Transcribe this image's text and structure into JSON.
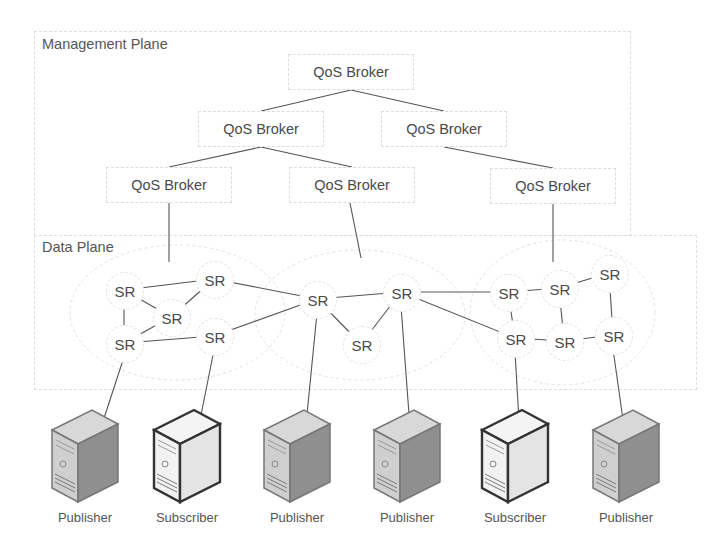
{
  "planes": {
    "management": {
      "label": "Management Plane"
    },
    "data": {
      "label": "Data Plane"
    }
  },
  "brokers": [
    {
      "id": "b0",
      "label": "QoS Broker",
      "x": 288,
      "y": 54
    },
    {
      "id": "b1",
      "label": "QoS Broker",
      "x": 198,
      "y": 111
    },
    {
      "id": "b2",
      "label": "QoS Broker",
      "x": 381,
      "y": 111
    },
    {
      "id": "b3",
      "label": "QoS Broker",
      "x": 106,
      "y": 167
    },
    {
      "id": "b4",
      "label": "QoS Broker",
      "x": 289,
      "y": 167
    },
    {
      "id": "b5",
      "label": "QoS Broker",
      "x": 490,
      "y": 168
    }
  ],
  "routers": [
    {
      "id": "s0",
      "label": "SR",
      "x": 124,
      "y": 290
    },
    {
      "id": "s1",
      "label": "SR",
      "x": 214,
      "y": 279
    },
    {
      "id": "s2",
      "label": "SR",
      "x": 171,
      "y": 317
    },
    {
      "id": "s3",
      "label": "SR",
      "x": 124,
      "y": 343
    },
    {
      "id": "s4",
      "label": "SR",
      "x": 214,
      "y": 336
    },
    {
      "id": "s5",
      "label": "SR",
      "x": 317,
      "y": 299
    },
    {
      "id": "s6",
      "label": "SR",
      "x": 401,
      "y": 292
    },
    {
      "id": "s7",
      "label": "SR",
      "x": 361,
      "y": 344
    },
    {
      "id": "s8",
      "label": "SR",
      "x": 508,
      "y": 292
    },
    {
      "id": "s9",
      "label": "SR",
      "x": 559,
      "y": 288
    },
    {
      "id": "s10",
      "label": "SR",
      "x": 609,
      "y": 273
    },
    {
      "id": "s11",
      "label": "SR",
      "x": 515,
      "y": 338
    },
    {
      "id": "s12",
      "label": "SR",
      "x": 564,
      "y": 341
    },
    {
      "id": "s13",
      "label": "SR",
      "x": 613,
      "y": 335
    }
  ],
  "hosts": [
    {
      "id": "h0",
      "role": "publisher",
      "label": "Publisher",
      "x": 50
    },
    {
      "id": "h1",
      "role": "subscriber",
      "label": "Subscriber",
      "x": 152
    },
    {
      "id": "h2",
      "role": "publisher",
      "label": "Publisher",
      "x": 262
    },
    {
      "id": "h3",
      "role": "publisher",
      "label": "Publisher",
      "x": 372
    },
    {
      "id": "h4",
      "role": "subscriber",
      "label": "Subscriber",
      "x": 480
    },
    {
      "id": "h5",
      "role": "publisher",
      "label": "Publisher",
      "x": 591
    }
  ],
  "broker_links": [
    [
      "b0",
      "b1"
    ],
    [
      "b0",
      "b2"
    ],
    [
      "b1",
      "b3"
    ],
    [
      "b1",
      "b4"
    ],
    [
      "b2",
      "b5"
    ]
  ],
  "broker_router_links": [
    {
      "from": [
        169,
        203
      ],
      "to": [
        169,
        262
      ]
    },
    {
      "from": [
        350,
        203
      ],
      "to": [
        361,
        258
      ]
    },
    {
      "from": [
        553,
        204
      ],
      "to": [
        553,
        262
      ]
    }
  ],
  "router_links": [
    [
      "s0",
      "s1"
    ],
    [
      "s0",
      "s2"
    ],
    [
      "s2",
      "s1"
    ],
    [
      "s0",
      "s3"
    ],
    [
      "s3",
      "s4"
    ],
    [
      "s3",
      "s2"
    ],
    [
      "s1",
      "s5"
    ],
    [
      "s4",
      "s5"
    ],
    [
      "s5",
      "s6"
    ],
    [
      "s5",
      "s7"
    ],
    [
      "s6",
      "s7"
    ],
    [
      "s6",
      "s8"
    ],
    [
      "s6",
      "s11"
    ],
    [
      "s8",
      "s9"
    ],
    [
      "s9",
      "s10"
    ],
    [
      "s8",
      "s11"
    ],
    [
      "s9",
      "s12"
    ],
    [
      "s11",
      "s12"
    ],
    [
      "s12",
      "s13"
    ],
    [
      "s10",
      "s13"
    ]
  ],
  "host_links": [
    {
      "from": "s3",
      "to": [
        92,
        455
      ]
    },
    {
      "from": "s4",
      "to": [
        193,
        455
      ]
    },
    {
      "from": "s5",
      "to": [
        303,
        455
      ]
    },
    {
      "from": "s6",
      "to": [
        412,
        455
      ]
    },
    {
      "from": "s11",
      "to": [
        521,
        455
      ]
    },
    {
      "from": "s13",
      "to": [
        628,
        455
      ]
    }
  ],
  "colors": {
    "line": "#555555",
    "dashed": "#dcdcdc",
    "text": "#4a4a4a"
  }
}
